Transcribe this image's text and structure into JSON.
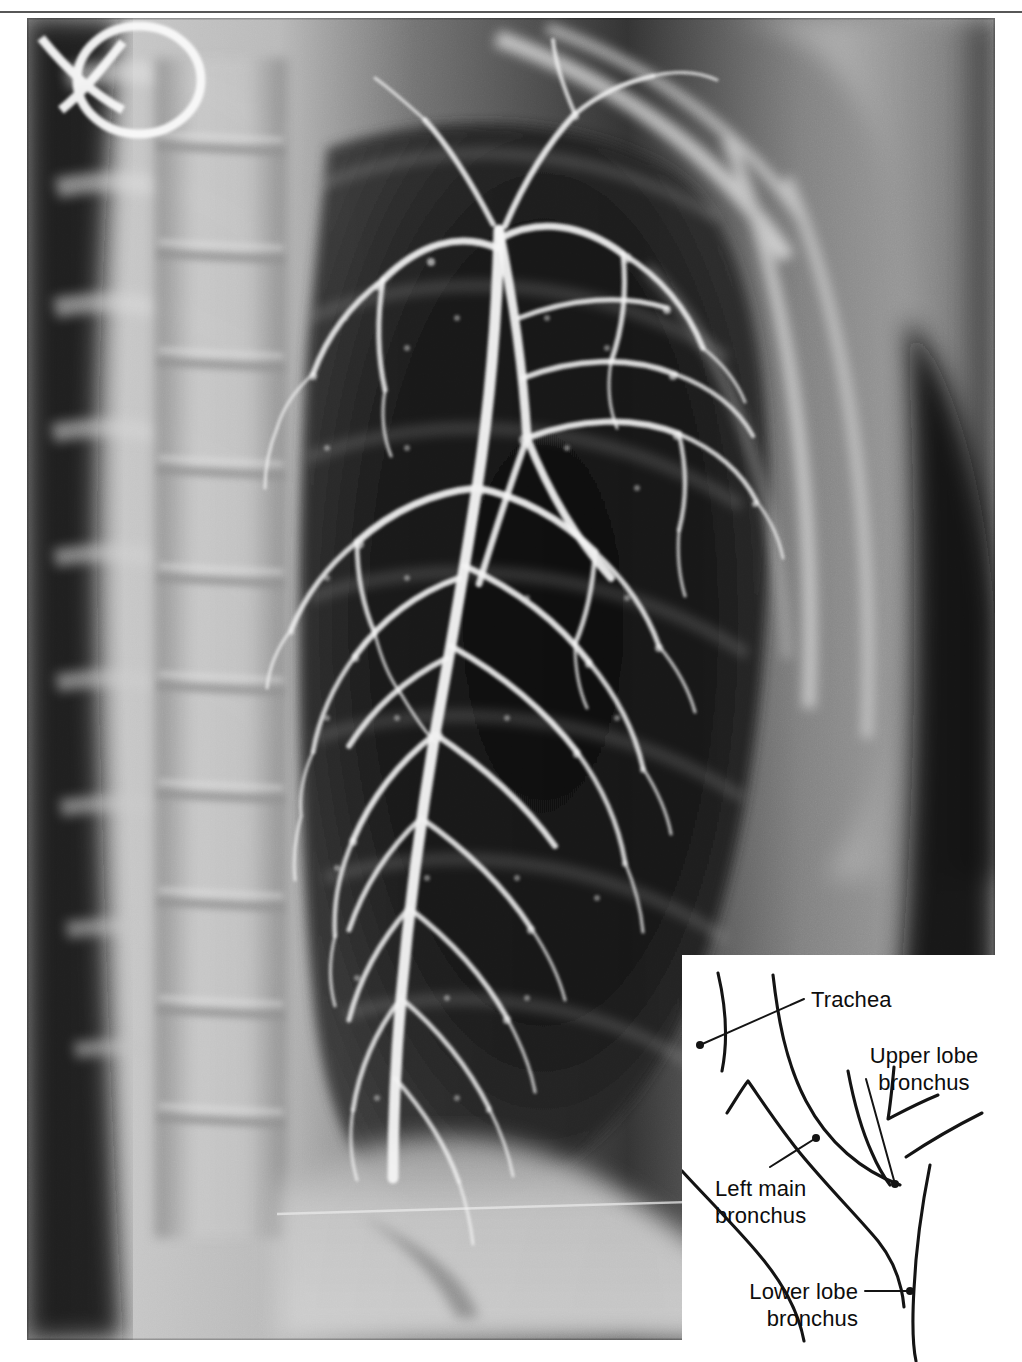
{
  "figure": {
    "kind": "radiograph-with-inset-diagram",
    "modality": "bronchogram",
    "view": "left lateral / oblique chest",
    "alt": "Chest bronchogram showing contrast-filled left bronchial tree with labelled line-drawing inset"
  },
  "xray": {
    "background_tone": "#c9c9c9",
    "lungfield_tone": "#1a1a1a",
    "contrast_tone": "#f2f2f2",
    "artifact": "ring-artifact-upper-left",
    "regions": [
      {
        "name": "vertebral-column",
        "tone": "#b4b4b4"
      },
      {
        "name": "lung-field",
        "tone": "#161616"
      },
      {
        "name": "soft-tissue-shoulder",
        "tone": "#9a9a9a"
      },
      {
        "name": "air-outside-body",
        "tone": "#0b0b0b"
      },
      {
        "name": "diaphragm",
        "tone": "#c4c4c4"
      }
    ]
  },
  "inset": {
    "background": "#ffffff",
    "stroke": "#141414",
    "labels": [
      {
        "id": "trachea",
        "text": "Trachea",
        "text2": "",
        "align": "left"
      },
      {
        "id": "upper-lobe-bronchus",
        "text": "Upper lobe",
        "text2": "bronchus",
        "align": "center"
      },
      {
        "id": "left-main-bronchus",
        "text": "Left main",
        "text2": "bronchus",
        "align": "left"
      },
      {
        "id": "lower-lobe-bronchus",
        "text": "Lower lobe",
        "text2": "bronchus",
        "align": "right"
      }
    ]
  }
}
